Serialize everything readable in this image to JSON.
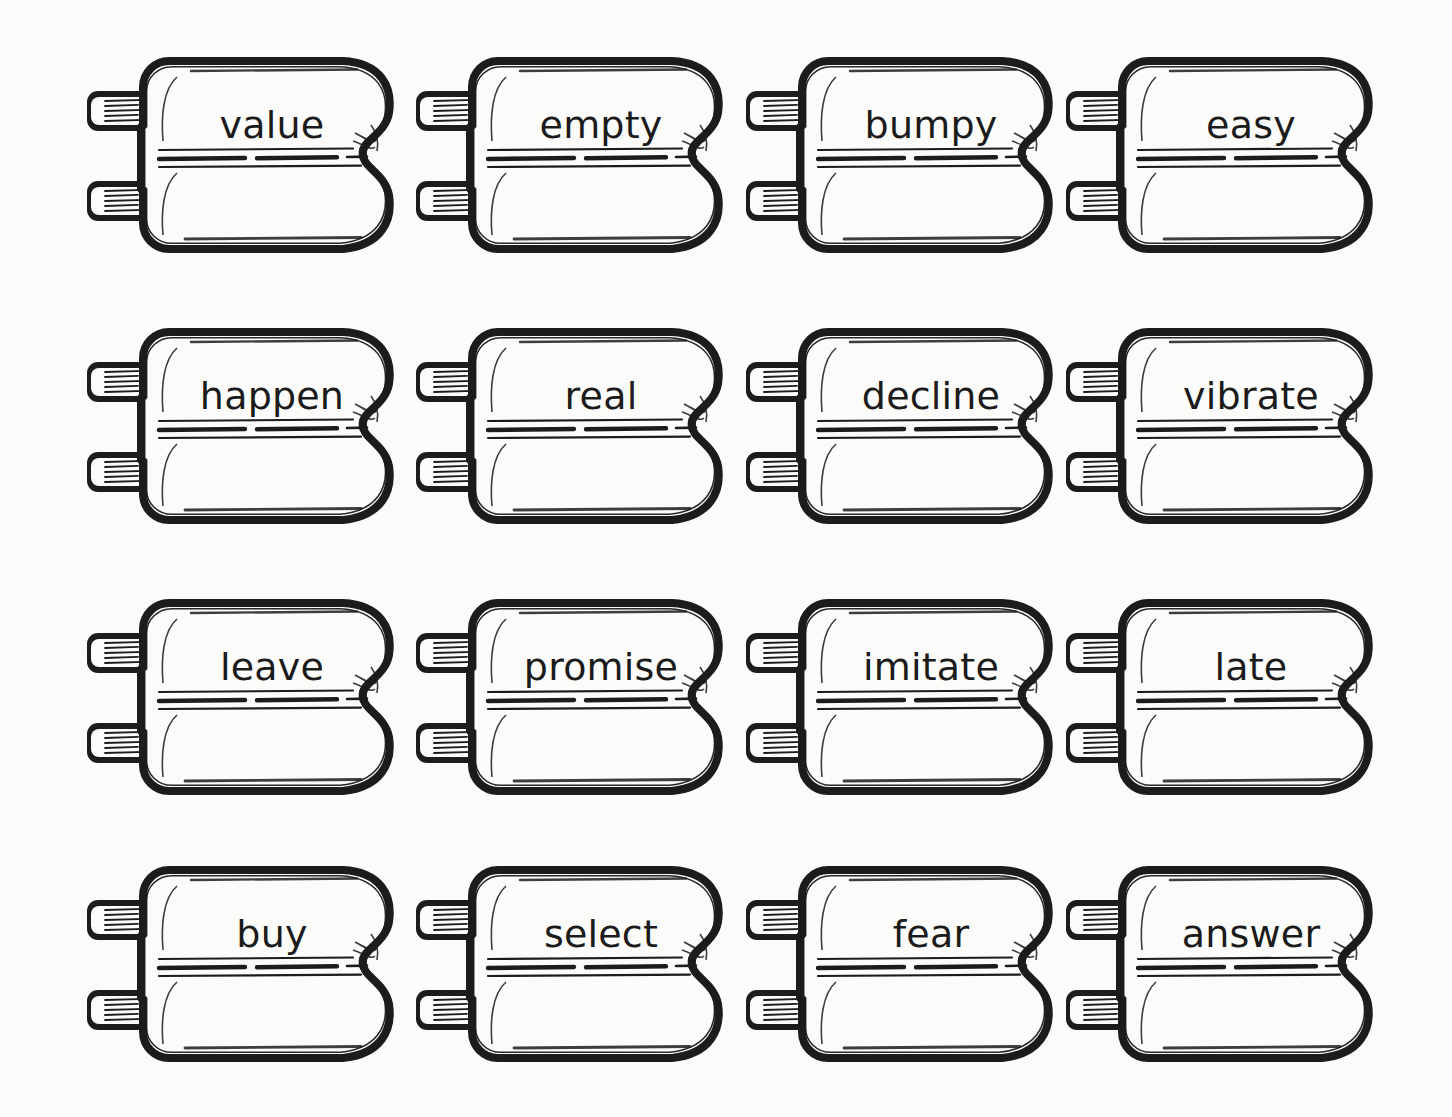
{
  "page": {
    "background_color": "#fbfbf9",
    "ink_color": "#1c1c1c",
    "rows": 4,
    "columns": 4,
    "total_cards": 16,
    "card_style": "scanned-ink-drawn plug card with two left connector tabs, wavy right edge, three horizontal ruling lines"
  },
  "cards": [
    {
      "word": "value",
      "row": 1,
      "col": 1
    },
    {
      "word": "empty",
      "row": 1,
      "col": 2
    },
    {
      "word": "bumpy",
      "row": 1,
      "col": 3
    },
    {
      "word": "easy",
      "row": 1,
      "col": 4
    },
    {
      "word": "happen",
      "row": 2,
      "col": 1
    },
    {
      "word": "real",
      "row": 2,
      "col": 2
    },
    {
      "word": "decline",
      "row": 2,
      "col": 3
    },
    {
      "word": "vibrate",
      "row": 2,
      "col": 4
    },
    {
      "word": "leave",
      "row": 3,
      "col": 1
    },
    {
      "word": "promise",
      "row": 3,
      "col": 2
    },
    {
      "word": "imitate",
      "row": 3,
      "col": 3
    },
    {
      "word": "late",
      "row": 3,
      "col": 4
    },
    {
      "word": "buy",
      "row": 4,
      "col": 1
    },
    {
      "word": "select",
      "row": 4,
      "col": 2
    },
    {
      "word": "fear",
      "row": 4,
      "col": 3
    },
    {
      "word": "answer",
      "row": 4,
      "col": 4
    }
  ],
  "layout": {
    "column_x": [
      85,
      414,
      744,
      1064
    ],
    "row_y": [
      55,
      326,
      597,
      864
    ],
    "card_width": 318,
    "card_height": 200,
    "word_baseline_offset": 48
  }
}
